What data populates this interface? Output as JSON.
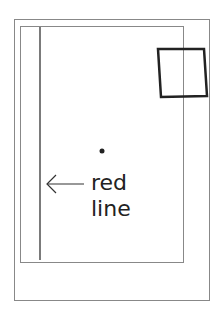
{
  "diagram": {
    "label_line1": "red",
    "label_line2": "line",
    "colors": {
      "stroke_light": "#888888",
      "stroke_dark": "#222222",
      "background": "#ffffff"
    }
  }
}
